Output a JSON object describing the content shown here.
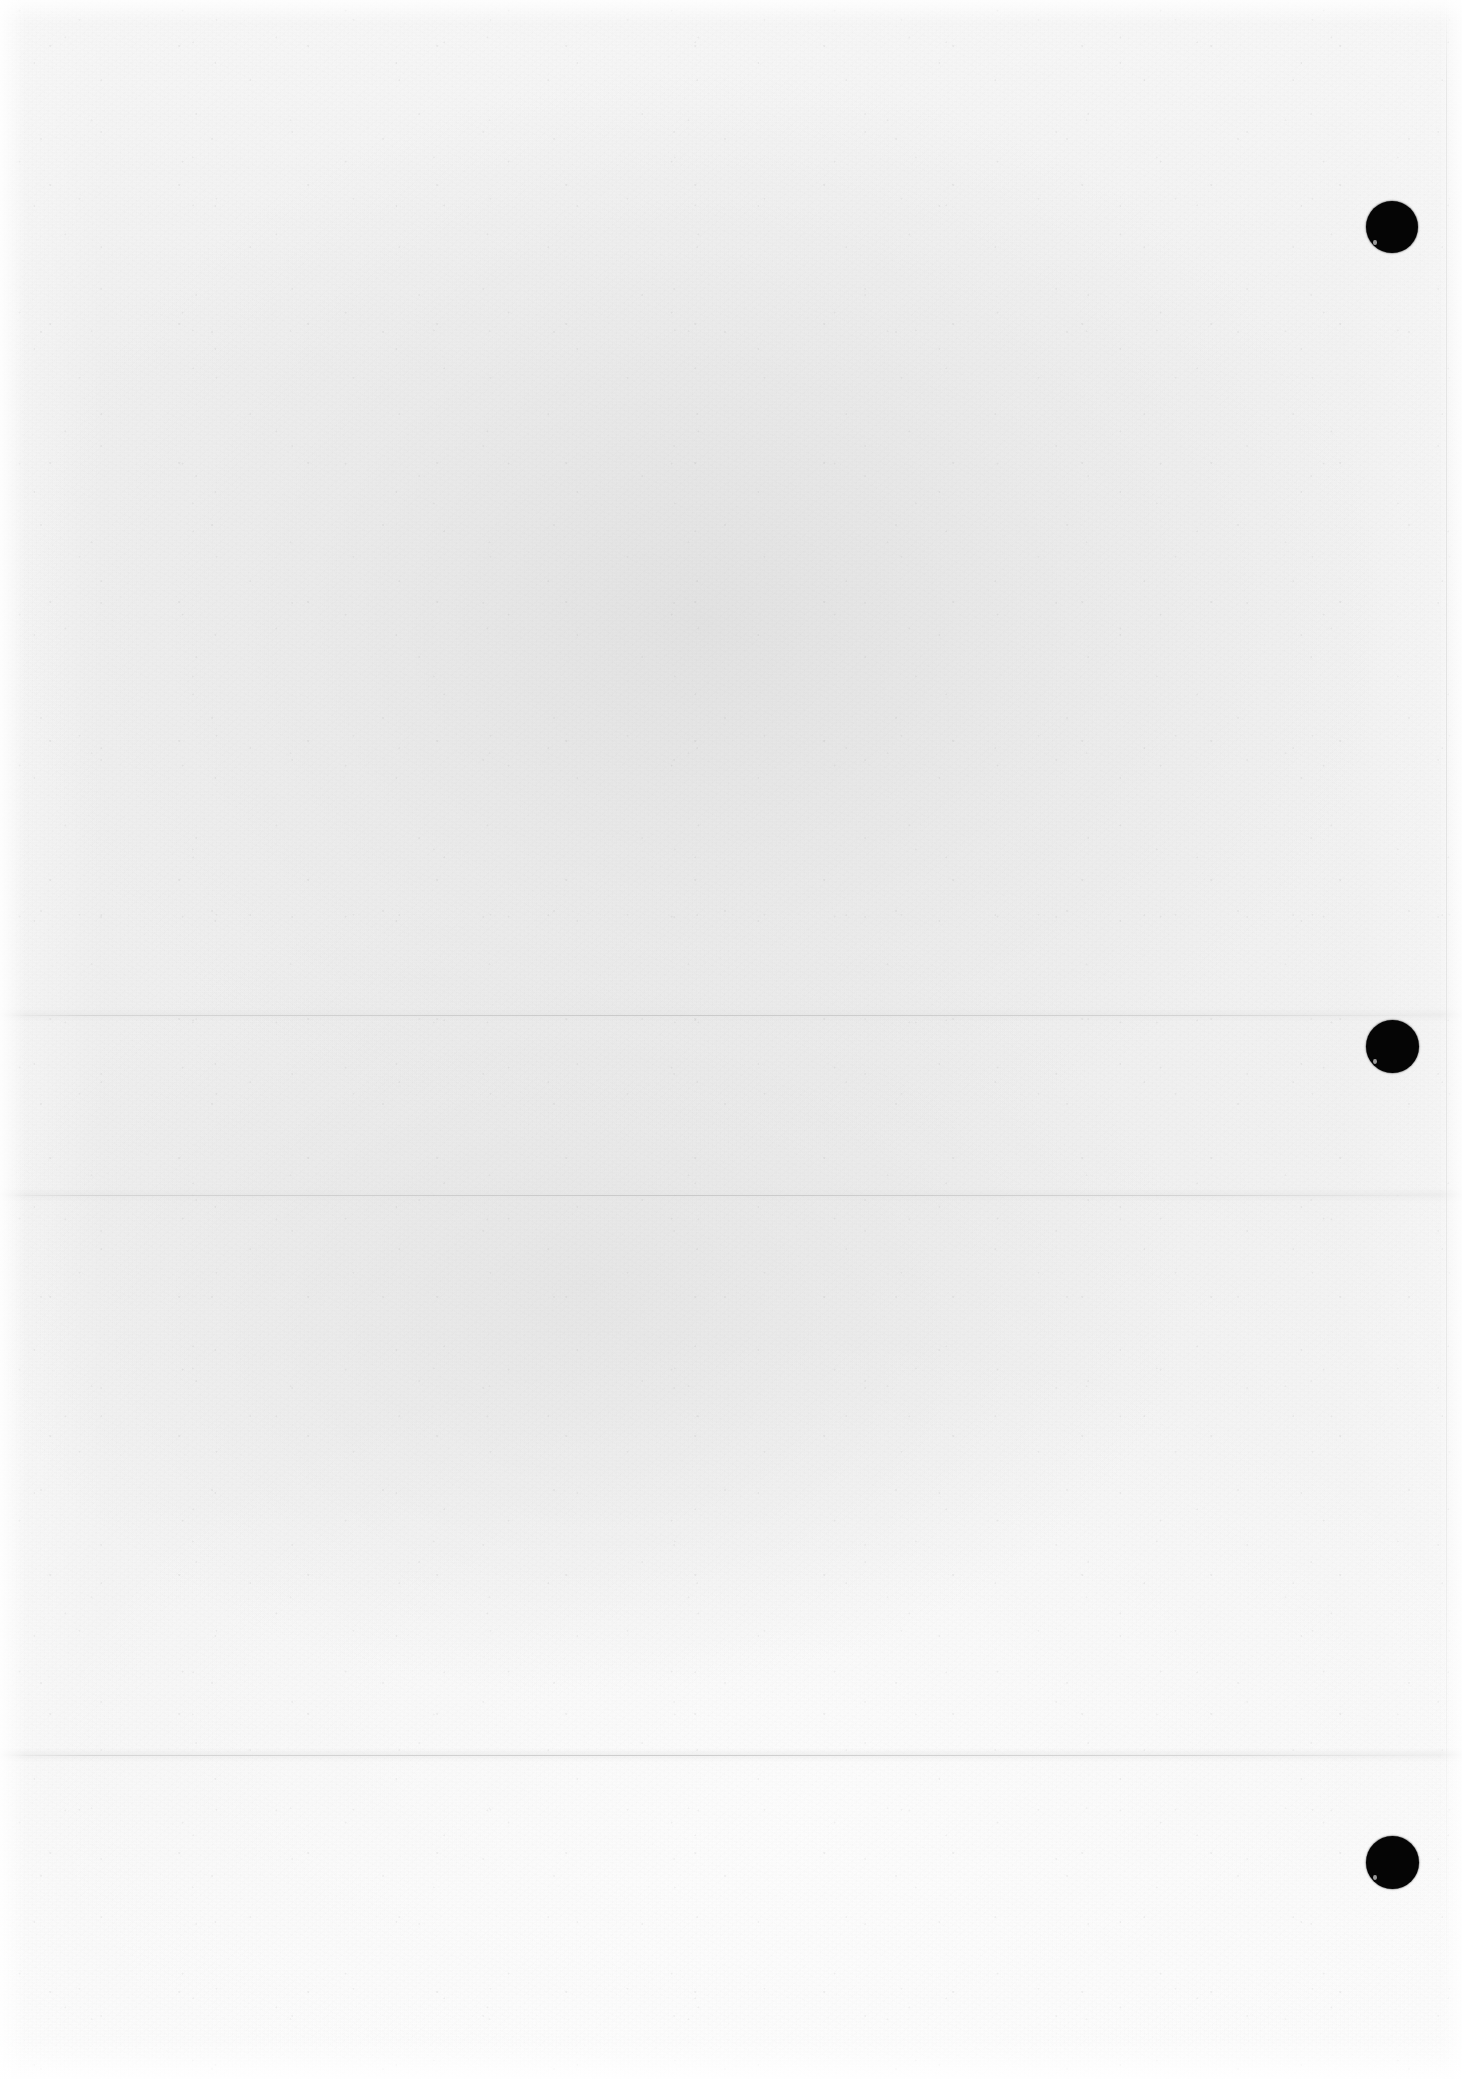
{
  "document": {
    "kind": "scanned-blank-page",
    "page_label": "",
    "body_text": "",
    "heading": "",
    "caption": "",
    "page_number": ""
  },
  "canvas": {
    "width": 1462,
    "height": 2079
  },
  "paper": {
    "base_color": "#f1f1f1",
    "highlight_color": "#fafafa",
    "shadow_color": "#e4e4e4",
    "texture": "fibrous-laid-paper"
  },
  "marks": {
    "punch_dots": [
      {
        "label": "",
        "color": "#050505",
        "cx": 1392,
        "cy": 227,
        "diameter": 52
      },
      {
        "label": "",
        "color": "#050505",
        "cx": 1392,
        "cy": 1046,
        "diameter": 53
      },
      {
        "label": "",
        "color": "#050505",
        "cx": 1392,
        "cy": 1862,
        "diameter": 53
      }
    ],
    "creases": [
      {
        "label": "",
        "y": 1015,
        "color": "#bebebe"
      },
      {
        "label": "",
        "y": 1195,
        "color": "#bababa"
      },
      {
        "label": "",
        "y": 1755,
        "color": "#bebebe"
      }
    ],
    "margin_rules": [
      {
        "label": "",
        "x": 1446,
        "color": "#c6c6c6"
      }
    ]
  }
}
